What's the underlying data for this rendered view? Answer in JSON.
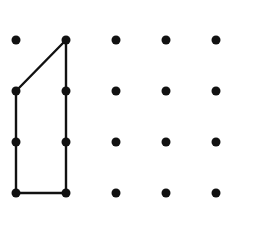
{
  "diagram": {
    "type": "geoboard-dot-grid",
    "background": "#ffffff",
    "ink_color": "#111111",
    "grid": {
      "columns_x": [
        16,
        66,
        116,
        166,
        216
      ],
      "rows_y": [
        40,
        91,
        142,
        193
      ],
      "dot_radius": 4.5
    },
    "polygon": {
      "vertices_grid": [
        [
          0,
          1
        ],
        [
          1,
          0
        ],
        [
          1,
          3
        ],
        [
          0,
          3
        ]
      ],
      "stroke_width": 2.4
    }
  }
}
